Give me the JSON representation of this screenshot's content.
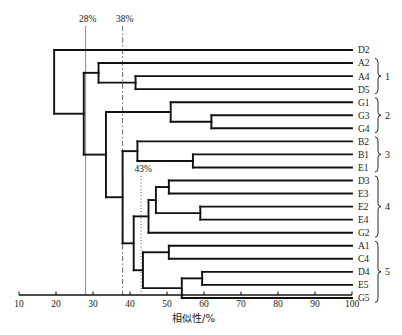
{
  "chart_data": {
    "type": "dendrogram",
    "title": "",
    "xlabel": "相似性/%",
    "ylabel": "",
    "xlim": [
      10,
      100
    ],
    "xticks": [
      10,
      20,
      30,
      40,
      50,
      60,
      70,
      80,
      90,
      100
    ],
    "xtick_labels": [
      "10",
      "20",
      "30",
      "40",
      "50",
      "60",
      "70",
      "80",
      "90",
      "100"
    ],
    "grid": false,
    "legend": "none",
    "orientation": "horizontal-leaves-right",
    "leaves": [
      {
        "label": "D2",
        "group": ""
      },
      {
        "label": "A2",
        "group": "1"
      },
      {
        "label": "A4",
        "group": "1"
      },
      {
        "label": "D5",
        "group": "1"
      },
      {
        "label": "G1",
        "group": "2"
      },
      {
        "label": "G3",
        "group": "2"
      },
      {
        "label": "G4",
        "group": "2"
      },
      {
        "label": "B2",
        "group": "3"
      },
      {
        "label": "B1",
        "group": "3"
      },
      {
        "label": "E1",
        "group": "3"
      },
      {
        "label": "D3",
        "group": "4"
      },
      {
        "label": "E3",
        "group": "4"
      },
      {
        "label": "E2",
        "group": "4"
      },
      {
        "label": "E4",
        "group": "4"
      },
      {
        "label": "G2",
        "group": "4"
      },
      {
        "label": "A1",
        "group": "5"
      },
      {
        "label": "C4",
        "group": "5"
      },
      {
        "label": "D4",
        "group": "5"
      },
      {
        "label": "E5",
        "group": "5"
      },
      {
        "label": "G5",
        "group": "5"
      }
    ],
    "groups": [
      {
        "label": "1",
        "members": [
          "A2",
          "A4",
          "D5"
        ]
      },
      {
        "label": "2",
        "members": [
          "G1",
          "G3",
          "G4"
        ]
      },
      {
        "label": "3",
        "members": [
          "B2",
          "B1",
          "E1"
        ]
      },
      {
        "label": "4",
        "members": [
          "D3",
          "E3",
          "E2",
          "E4",
          "G2"
        ]
      },
      {
        "label": "5",
        "members": [
          "A1",
          "C4",
          "D4",
          "E5",
          "G5"
        ]
      }
    ],
    "merges": [
      {
        "id": "n_A4_D5",
        "similarity": 41.5,
        "children": [
          "A4",
          "D5"
        ]
      },
      {
        "id": "n_A2",
        "similarity": 31.5,
        "children": [
          "A2",
          "n_A4_D5"
        ]
      },
      {
        "id": "n_G3_G4",
        "similarity": 62.0,
        "children": [
          "G3",
          "G4"
        ]
      },
      {
        "id": "n_G1",
        "similarity": 51.0,
        "children": [
          "G1",
          "n_G3_G4"
        ]
      },
      {
        "id": "n_B1_E1",
        "similarity": 57.0,
        "children": [
          "B1",
          "E1"
        ]
      },
      {
        "id": "n_B2",
        "similarity": 42.0,
        "children": [
          "B2",
          "n_B1_E1"
        ]
      },
      {
        "id": "n_D3_E3",
        "similarity": 50.5,
        "children": [
          "D3",
          "E3"
        ]
      },
      {
        "id": "n_E2_E4",
        "similarity": 59.0,
        "children": [
          "E2",
          "E4"
        ]
      },
      {
        "id": "n_D3E3_E2E4",
        "similarity": 47.0,
        "children": [
          "n_D3_E3",
          "n_E2_E4"
        ]
      },
      {
        "id": "n_grp4",
        "similarity": 45.0,
        "children": [
          "n_D3E3_E2E4",
          "G2"
        ]
      },
      {
        "id": "n_A1_C4",
        "similarity": 50.5,
        "children": [
          "A1",
          "C4"
        ]
      },
      {
        "id": "n_D4_E5",
        "similarity": 59.5,
        "children": [
          "D4",
          "E5"
        ]
      },
      {
        "id": "n_D4E5_G5",
        "similarity": 54.0,
        "children": [
          "n_D4_E5",
          "G5"
        ]
      },
      {
        "id": "n_grp5",
        "similarity": 43.5,
        "children": [
          "n_A1_C4",
          "n_D4E5_G5"
        ]
      },
      {
        "id": "n_grp4_grp5",
        "similarity": 41.0,
        "children": [
          "n_grp4",
          "n_grp5"
        ]
      },
      {
        "id": "n_grp3_45",
        "similarity": 38.0,
        "children": [
          "n_B2",
          "n_grp4_grp5"
        ]
      },
      {
        "id": "n_grp2_345",
        "similarity": 33.5,
        "children": [
          "n_G1",
          "n_grp3_45"
        ]
      },
      {
        "id": "n_grp1_rest",
        "similarity": 27.5,
        "children": [
          "n_A2",
          "n_grp2_345"
        ]
      },
      {
        "id": "n_root",
        "similarity": 19.5,
        "children": [
          "D2",
          "n_grp1_rest"
        ]
      }
    ],
    "cut_lines": [
      {
        "label": "28%",
        "value": 28,
        "style": "solid"
      },
      {
        "label": "38%",
        "value": 38,
        "style": "dash-dot"
      },
      {
        "label": "43%",
        "value": 43,
        "style": "dotted"
      }
    ]
  }
}
